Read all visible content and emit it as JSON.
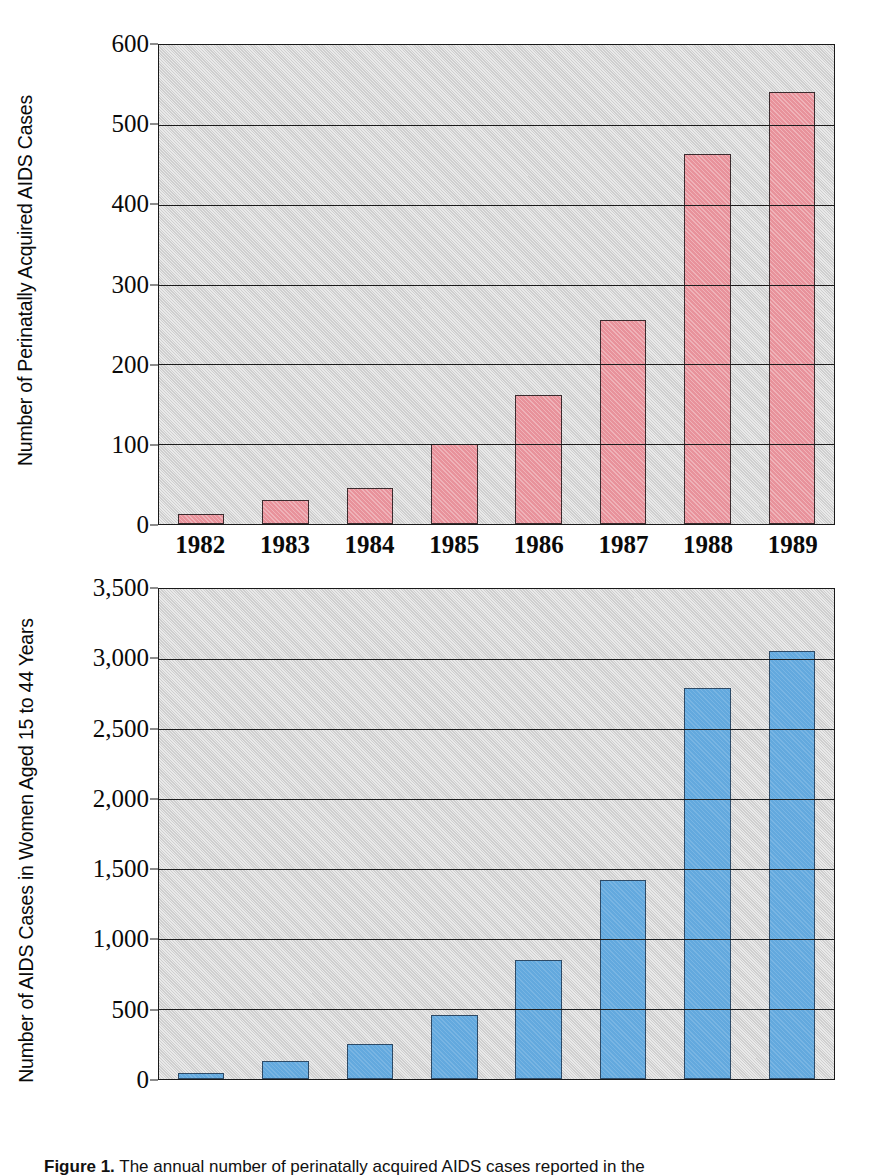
{
  "figure": {
    "caption_label": "Figure 1.",
    "caption_text": "The annual number of perinatally acquired AIDS cases reported in the"
  },
  "chart_data": [
    {
      "id": "perinatal",
      "type": "bar",
      "title": "",
      "xlabel": "",
      "ylabel": "Number of Perinatally Acquired AIDS Cases",
      "categories": [
        "1982",
        "1983",
        "1984",
        "1985",
        "1986",
        "1987",
        "1988",
        "1989"
      ],
      "values": [
        12,
        30,
        45,
        100,
        162,
        256,
        463,
        541
      ],
      "ylim": [
        0,
        600
      ],
      "yticks": [
        0,
        100,
        200,
        300,
        400,
        500,
        600
      ],
      "ytick_labels": [
        "0",
        "100",
        "200",
        "300",
        "400",
        "500",
        "600"
      ],
      "grid": true,
      "legend": "none",
      "bar_color": "#e8929b",
      "bar_edge_color": "#3a2b2e",
      "plot_background": "#cfcfcf"
    },
    {
      "id": "women-15-44",
      "type": "bar",
      "title": "",
      "xlabel": "",
      "ylabel": "Number of AIDS Cases in Women Aged 15 to 44 Years",
      "categories": [
        "1982",
        "1983",
        "1984",
        "1985",
        "1986",
        "1987",
        "1988",
        "1989"
      ],
      "values": [
        45,
        130,
        250,
        460,
        850,
        1420,
        2790,
        3060
      ],
      "ylim": [
        0,
        3500
      ],
      "yticks": [
        0,
        500,
        1000,
        1500,
        2000,
        2500,
        3000,
        3500
      ],
      "ytick_labels": [
        "0",
        "500",
        "1,000",
        "1,500",
        "2,000",
        "2,500",
        "3,000",
        "3,500"
      ],
      "grid": true,
      "legend": "none",
      "bar_color": "#63a9de",
      "bar_edge_color": "#2d4a66",
      "plot_background": "#cfcfcf"
    }
  ]
}
